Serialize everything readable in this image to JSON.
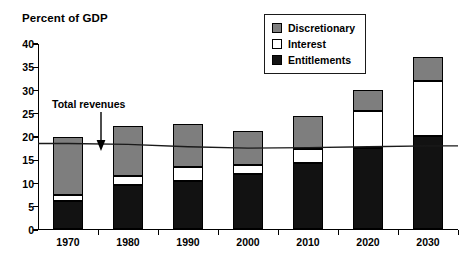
{
  "chart_data": {
    "type": "bar",
    "title": "Percent of GDP",
    "subtitle": "",
    "xlabel": "",
    "ylabel": "",
    "stacked": true,
    "grid": false,
    "legend_position": "top-right",
    "categories": [
      "1970",
      "1980",
      "1990",
      "2000",
      "2010",
      "2020",
      "2030"
    ],
    "ylim": [
      0,
      40
    ],
    "yticks": [
      0,
      5,
      10,
      15,
      20,
      25,
      30,
      35,
      40
    ],
    "ytick_labels": [
      "0",
      "5",
      "10",
      "15",
      "20",
      "25",
      "30",
      "35",
      "40"
    ],
    "series": [
      {
        "name": "Entitlements",
        "color": "#121212",
        "values": [
          6.0,
          9.5,
          10.3,
          11.8,
          14.3,
          17.5,
          20.0
        ]
      },
      {
        "name": "Interest",
        "color": "#ffffff",
        "values": [
          1.3,
          1.9,
          3.2,
          2.1,
          3.0,
          8.0,
          12.0
        ]
      },
      {
        "name": "Discretionary",
        "color": "#7e7e7e",
        "values": [
          12.5,
          10.9,
          9.2,
          7.3,
          7.1,
          4.5,
          5.0
        ]
      }
    ],
    "totals": [
      19.8,
      22.3,
      22.7,
      21.2,
      24.4,
      30.0,
      37.0
    ],
    "overlay_line": {
      "name": "Total revenues",
      "values": [
        18.6,
        18.4,
        17.9,
        17.6,
        17.7,
        17.9,
        18.1
      ],
      "color": "#1a1a1a"
    },
    "annotations": [
      {
        "text": "Total revenues",
        "points_to": "total-revenues-line"
      }
    ]
  },
  "legend": {
    "items": [
      {
        "label": "Discretionary",
        "swatch": "gray"
      },
      {
        "label": "Interest",
        "swatch": "white"
      },
      {
        "label": "Entitlements",
        "swatch": "black"
      }
    ]
  }
}
